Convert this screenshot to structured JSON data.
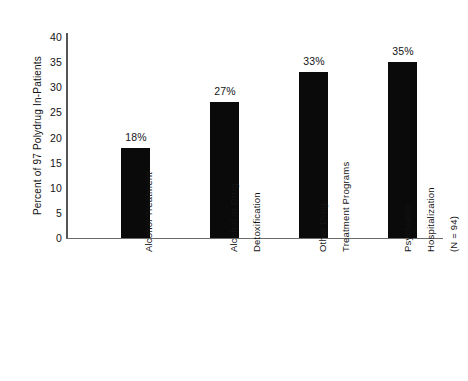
{
  "chart_data": {
    "type": "bar",
    "title": "",
    "subtitle": "",
    "xlabel": "",
    "ylabel": "Percent of 97 Polydrug In-Patients",
    "ylim": [
      0,
      40
    ],
    "ytick_step": 5,
    "ytick_labels": [
      "40",
      "35",
      "30",
      "25",
      "20",
      "15",
      "10",
      "5",
      "0"
    ],
    "grid": false,
    "legend": null,
    "bar_color": "#0a0a0a",
    "axis_color": "#555555",
    "background_color": "#ffffff",
    "categories": [
      "Alcohol Treatment",
      "Alcohol or Drug Detoxification",
      "Other Drug Treatment Programs",
      "Psychiatric Hospitalization (N = 94)"
    ],
    "category_lines": [
      [
        "Alcohol Treatment"
      ],
      [
        "Alcohol or Drug",
        "Detoxification"
      ],
      [
        "Other Drug",
        "Treatment Programs"
      ],
      [
        "Psychiatric",
        "Hospitalization",
        "(N = 94)"
      ]
    ],
    "values": [
      18,
      27,
      33,
      35
    ],
    "value_labels": [
      "18%",
      "27%",
      "33%",
      "35%"
    ]
  },
  "axis": {
    "y_title": "Percent of 97 Polydrug In-Patients",
    "ticks": [
      "40",
      "35",
      "30",
      "25",
      "20",
      "15",
      "10",
      "5",
      "0"
    ]
  },
  "bars": [
    {
      "label": "18%",
      "value": 18,
      "category": "Alcohol Treatment"
    },
    {
      "label": "27%",
      "value": 27,
      "category": "Alcohol or Drug Detoxification"
    },
    {
      "label": "33%",
      "value": 33,
      "category": "Other Drug Treatment Programs"
    },
    {
      "label": "35%",
      "value": 35,
      "category": "Psychiatric Hospitalization (N = 94)"
    }
  ],
  "categories": {
    "c0": {
      "l0": "Alcohol Treatment"
    },
    "c1": {
      "l0": "Alcohol or Drug",
      "l1": "Detoxification"
    },
    "c2": {
      "l0": "Other Drug",
      "l1": "Treatment Programs"
    },
    "c3": {
      "l0": "Psychiatric",
      "l1": "Hospitalization",
      "l2": "(N = 94)"
    }
  }
}
